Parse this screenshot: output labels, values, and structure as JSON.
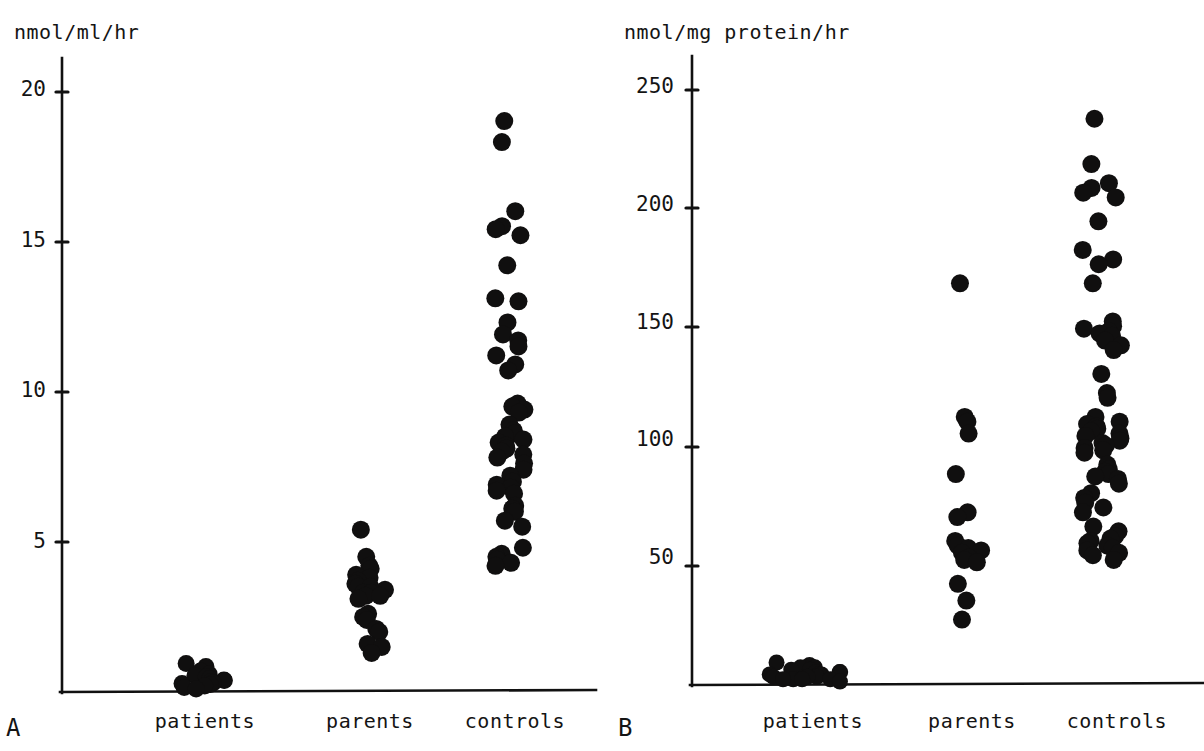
{
  "figure": {
    "type": "scatter-dotplot-figure",
    "background": "#ffffff",
    "ink_color": "#111111"
  },
  "panels": [
    {
      "letter": "A",
      "unit_label": "nmol/ml/hr",
      "groups": [
        "patients",
        "parents",
        "controls"
      ]
    },
    {
      "letter": "B",
      "unit_label": "nmol/mg protein/hr",
      "groups": [
        "patients",
        "parents",
        "controls"
      ]
    }
  ],
  "chart_data": [
    {
      "type": "scatter",
      "panel": "A",
      "title": "",
      "xlabel": "",
      "ylabel": "nmol/ml/hr",
      "ylim": [
        0,
        21
      ],
      "yticks": [
        5,
        10,
        15,
        20
      ],
      "ytick_labels": [
        "5",
        "10",
        "15",
        "20"
      ],
      "grid": false,
      "legend": "none",
      "categories": [
        "patients",
        "parents",
        "controls"
      ],
      "series": [
        {
          "name": "patients",
          "values": [
            0.95,
            0.85,
            0.7,
            0.6,
            0.55,
            0.5,
            0.45,
            0.4,
            0.38,
            0.35,
            0.3,
            0.28,
            0.25,
            0.2,
            0.15,
            0.1
          ]
        },
        {
          "name": "parents",
          "values": [
            5.4,
            4.5,
            4.2,
            4.1,
            3.9,
            3.8,
            3.7,
            3.6,
            3.5,
            3.5,
            3.4,
            3.3,
            3.3,
            3.2,
            3.2,
            3.1,
            2.6,
            2.5,
            2.4,
            2.1,
            2.0,
            1.6,
            1.5,
            1.3
          ]
        },
        {
          "name": "controls",
          "values": [
            19.0,
            18.3,
            16.0,
            15.5,
            15.4,
            15.2,
            14.2,
            13.1,
            13.0,
            12.3,
            11.9,
            11.7,
            11.5,
            11.2,
            10.9,
            10.7,
            9.6,
            9.5,
            9.4,
            9.3,
            8.9,
            8.7,
            8.6,
            8.5,
            8.4,
            8.3,
            8.2,
            8.1,
            8.0,
            7.9,
            7.8,
            7.6,
            7.4,
            7.2,
            7.0,
            6.9,
            6.8,
            6.7,
            6.6,
            6.2,
            6.1,
            6.0,
            5.7,
            5.5,
            4.8,
            4.6,
            4.5,
            4.4,
            4.3,
            4.2
          ]
        }
      ]
    },
    {
      "type": "scatter",
      "panel": "B",
      "title": "",
      "xlabel": "",
      "ylabel": "nmol/mg protein/hr",
      "ylim": [
        0,
        265
      ],
      "yticks": [
        50,
        100,
        150,
        200,
        250
      ],
      "ytick_labels": [
        "50",
        "100",
        "150",
        "200",
        "250"
      ],
      "grid": false,
      "legend": "none",
      "categories": [
        "patients",
        "parents",
        "controls"
      ],
      "series": [
        {
          "name": "patients",
          "values": [
            9,
            8,
            7,
            7,
            6,
            6,
            5,
            5,
            5,
            4,
            4,
            4,
            3,
            3,
            3,
            2,
            2,
            2,
            2,
            1
          ]
        },
        {
          "name": "parents",
          "values": [
            168,
            112,
            110,
            105,
            88,
            72,
            70,
            60,
            58,
            57,
            56,
            55,
            53,
            52,
            51,
            42,
            35,
            27
          ]
        },
        {
          "name": "controls",
          "values": [
            237,
            218,
            210,
            208,
            206,
            204,
            194,
            182,
            178,
            176,
            168,
            152,
            150,
            149,
            148,
            147,
            146,
            144,
            142,
            140,
            130,
            122,
            120,
            112,
            110,
            109,
            108,
            107,
            106,
            105,
            104,
            103,
            102,
            101,
            100,
            99,
            98,
            97,
            92,
            90,
            89,
            88,
            87,
            86,
            84,
            80,
            78,
            76,
            74,
            72,
            66,
            64,
            62,
            61,
            60,
            59,
            58,
            57,
            56,
            55,
            54,
            52
          ]
        }
      ]
    }
  ]
}
